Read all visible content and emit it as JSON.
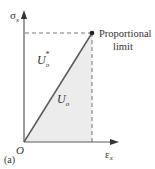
{
  "diagram": {
    "panel_label": "(a)",
    "axes": {
      "y_label": "σ",
      "y_sub": "x",
      "x_label": "ε",
      "x_sub": "x",
      "origin_label": "O"
    },
    "point": {
      "label_line1": "Proportional",
      "label_line2": "limit"
    },
    "regions": {
      "upper_label": "U",
      "upper_sub": "o",
      "upper_sup": "*",
      "lower_label": "U",
      "lower_sub": "o"
    },
    "colors": {
      "line": "#5a5a5a",
      "fill": "#ececec",
      "text": "#333333"
    }
  }
}
